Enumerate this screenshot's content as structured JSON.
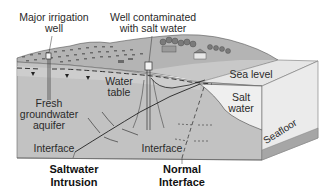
{
  "diagram": {
    "labels": {
      "major_irrigation_well": [
        "Major irrigation",
        "well"
      ],
      "contaminated_well": [
        "Well contaminated",
        "with salt water"
      ],
      "water_table": [
        "Water",
        "table"
      ],
      "fresh_aquifer": [
        "Fresh",
        "groundwater",
        "aquifer"
      ],
      "interface_left": "Interface",
      "interface_right": "Interface",
      "sea_level": "Sea level",
      "salt_water": [
        "Salt",
        "water"
      ],
      "seafloor": "Seafloor",
      "saltwater_intrusion": [
        "Saltwater",
        "Intrusion"
      ],
      "normal_interface": [
        "Normal",
        "Interface"
      ]
    },
    "colors": {
      "background": "#ffffff",
      "aquifer": "#c4c4c4",
      "aquifer_light": "#d6d6d6",
      "salt_water": "#ececec",
      "sea_top": "#e2e2e2",
      "sea_side": "#e9e9e9",
      "seafloor": "#a8a8a8",
      "land_surface": "#b0b0b0",
      "land_dark": "#6e6e6e",
      "line": "#2a2a2a"
    }
  }
}
